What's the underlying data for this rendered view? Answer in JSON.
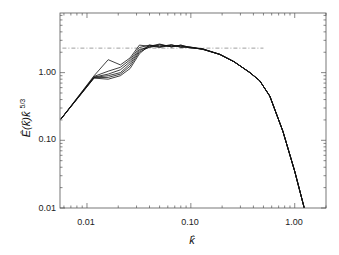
{
  "chart_data": {
    "type": "line",
    "title": "",
    "xlabel": "k̂",
    "ylabel": "Ê(k̂)k̂",
    "ylabel_exponent": "5/3",
    "xscale": "log",
    "yscale": "log",
    "xlim": [
      0.0055,
      2.0
    ],
    "ylim": [
      0.01,
      7.6
    ],
    "grid": false,
    "legend": "none",
    "x_ticks": [
      {
        "value": 0.01,
        "label": "0.01"
      },
      {
        "value": 0.1,
        "label": "0.10"
      },
      {
        "value": 1.0,
        "label": "1.00"
      }
    ],
    "y_ticks": [
      {
        "value": 0.01,
        "label": "0.01"
      },
      {
        "value": 0.1,
        "label": "0.10"
      },
      {
        "value": 1.0,
        "label": "1.00"
      }
    ],
    "reference_line": {
      "style": "dash-dot",
      "y": 2.3,
      "x_range": [
        0.0058,
        0.5
      ],
      "color": "#888888"
    },
    "series": [
      {
        "name": "spectrum-1",
        "x": [
          0.0056,
          0.0117,
          0.016,
          0.021,
          0.026,
          0.032,
          0.04,
          0.05,
          0.065,
          0.08,
          0.098,
          0.13,
          0.19,
          0.26,
          0.37,
          0.46,
          0.575,
          0.77,
          1.0,
          1.25
        ],
        "y": [
          0.205,
          0.9,
          1.55,
          1.3,
          1.65,
          2.55,
          2.45,
          2.65,
          2.4,
          2.55,
          2.36,
          2.25,
          1.86,
          1.45,
          1.0,
          0.76,
          0.45,
          0.136,
          0.035,
          0.0093
        ]
      },
      {
        "name": "spectrum-2",
        "x": [
          0.0056,
          0.0117,
          0.016,
          0.021,
          0.026,
          0.032,
          0.04,
          0.05,
          0.065,
          0.08,
          0.098,
          0.13,
          0.19,
          0.26,
          0.37,
          0.46,
          0.575,
          0.77,
          1.0,
          1.25
        ],
        "y": [
          0.205,
          0.88,
          1.05,
          1.2,
          1.55,
          2.35,
          2.55,
          2.4,
          2.6,
          2.35,
          2.4,
          2.22,
          1.86,
          1.45,
          1.0,
          0.76,
          0.45,
          0.136,
          0.035,
          0.0093
        ]
      },
      {
        "name": "spectrum-3",
        "x": [
          0.0056,
          0.0117,
          0.016,
          0.021,
          0.026,
          0.032,
          0.04,
          0.05,
          0.065,
          0.08,
          0.098,
          0.13,
          0.19,
          0.26,
          0.37,
          0.46,
          0.575,
          0.77,
          1.0,
          1.25
        ],
        "y": [
          0.205,
          0.86,
          0.95,
          1.1,
          1.45,
          2.2,
          2.35,
          2.55,
          2.45,
          2.5,
          2.32,
          2.24,
          1.86,
          1.45,
          1.0,
          0.76,
          0.45,
          0.136,
          0.035,
          0.0093
        ]
      },
      {
        "name": "spectrum-4",
        "x": [
          0.0056,
          0.0117,
          0.016,
          0.021,
          0.026,
          0.032,
          0.04,
          0.05,
          0.065,
          0.08,
          0.098,
          0.13,
          0.19,
          0.26,
          0.37,
          0.46,
          0.575,
          0.77,
          1.0,
          1.25
        ],
        "y": [
          0.205,
          0.85,
          0.9,
          1.0,
          1.35,
          2.1,
          2.5,
          2.35,
          2.55,
          2.4,
          2.38,
          2.2,
          1.86,
          1.45,
          1.0,
          0.76,
          0.45,
          0.136,
          0.035,
          0.0093
        ]
      },
      {
        "name": "spectrum-5",
        "x": [
          0.0056,
          0.0117,
          0.016,
          0.021,
          0.026,
          0.032,
          0.04,
          0.05,
          0.065,
          0.08,
          0.098,
          0.13,
          0.19,
          0.26,
          0.37,
          0.46,
          0.575,
          0.77,
          1.0,
          1.25
        ],
        "y": [
          0.205,
          0.84,
          0.85,
          0.95,
          1.25,
          2.0,
          2.4,
          2.6,
          2.4,
          2.55,
          2.34,
          2.23,
          1.86,
          1.45,
          1.0,
          0.76,
          0.45,
          0.136,
          0.035,
          0.0093
        ]
      },
      {
        "name": "spectrum-6",
        "x": [
          0.0056,
          0.0117,
          0.016,
          0.021,
          0.026,
          0.032,
          0.04,
          0.05,
          0.065,
          0.08,
          0.098,
          0.13,
          0.19,
          0.26,
          0.37,
          0.46,
          0.575,
          0.77,
          1.0,
          1.25
        ],
        "y": [
          0.205,
          0.83,
          0.8,
          0.9,
          1.15,
          1.9,
          2.55,
          2.45,
          2.5,
          2.45,
          2.36,
          2.21,
          1.86,
          1.45,
          1.0,
          0.76,
          0.45,
          0.136,
          0.035,
          0.0093
        ]
      }
    ]
  },
  "axes": {
    "x_label": "k̂",
    "y_label_base": "Ê(k̂)k̂",
    "y_label_exp": "5/3",
    "x_tick_labels": [
      "0.01",
      "0.10",
      "1.00"
    ],
    "y_tick_labels": [
      "0.01",
      "0.10",
      "1.00"
    ]
  }
}
